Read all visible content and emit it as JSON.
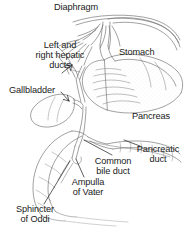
{
  "figure": {
    "style": "grayscale pen-and-ink line drawing",
    "width": 186,
    "height": 237,
    "background_color": "#ffffff",
    "ink_color": "#6e6e6e",
    "text_color": "#1a1a1a"
  },
  "labels": {
    "diaphragm": "Diaphragm",
    "hepatic_ducts_line1": "Left and",
    "hepatic_ducts_line2": "right hepatic",
    "hepatic_ducts_line3": "ducts",
    "stomach": "Stomach",
    "gallbladder": "Gallbladder",
    "pancreas": "Pancreas",
    "pancreatic_duct_line1": "Pancreatic",
    "pancreatic_duct_line2": "duct",
    "common_bile_duct_line1": "Common",
    "common_bile_duct_line2": "bile duct",
    "ampulla_line1": "Ampulla",
    "ampulla_line2": "of Vater",
    "sphincter_line1": "Sphincter",
    "sphincter_line2": "of Oddi"
  },
  "structures": [
    {
      "name": "diaphragm",
      "description": "arched dome with radiating muscle fibers across the top of the figure"
    },
    {
      "name": "esophagus",
      "description": "tube descending through the diaphragm into the stomach"
    },
    {
      "name": "stomach",
      "description": "large stippled sac occupying the upper right"
    },
    {
      "name": "liver",
      "description": "implied lobe above the gallbladder at upper left"
    },
    {
      "name": "gallbladder",
      "description": "small pear-shaped sac at mid left"
    },
    {
      "name": "left-and-right-hepatic-ducts",
      "description": "paired branching ducts joining above the gallbladder"
    },
    {
      "name": "common-bile-duct",
      "description": "duct descending from the cystic and hepatic duct junction"
    },
    {
      "name": "pancreas",
      "description": "elongated gland to the right of the duodenum"
    },
    {
      "name": "pancreatic-duct",
      "description": "duct running through the pancreas to join the bile duct"
    },
    {
      "name": "ampulla-of-vater",
      "description": "dilated junction where bile and pancreatic ducts meet the duodenum"
    },
    {
      "name": "sphincter-of-oddi",
      "description": "muscular ring at the ampulla opening"
    },
    {
      "name": "duodenum",
      "description": "C-shaped curve of small intestine at lower left"
    }
  ]
}
